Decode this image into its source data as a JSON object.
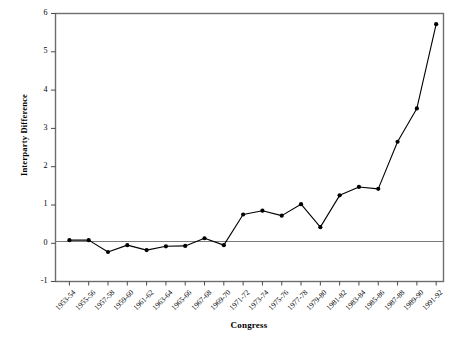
{
  "chart_data": {
    "type": "line",
    "title": "",
    "xlabel": "Congress",
    "ylabel": "Interparty Difference",
    "ylim": [
      -1,
      6
    ],
    "yticks": [
      -1,
      0,
      1,
      2,
      3,
      4,
      5,
      6
    ],
    "ytick_labels": [
      "-1",
      "0",
      "1",
      "2",
      "3",
      "4",
      "5",
      "6"
    ],
    "grid": false,
    "legend": null,
    "marker": "filled-circle",
    "line_color": "#000000",
    "zero_line": true,
    "categories": [
      "1953-54",
      "1955-56",
      "1957-58",
      "1959-60",
      "1961-62",
      "1963-64",
      "1965-66",
      "1967-68",
      "1969-70",
      "1971-72",
      "1973-74",
      "1975-76",
      "1977-78",
      "1979-80",
      "1981-82",
      "1983-84",
      "1985-86",
      "1987-88",
      "1989-90",
      "1991-92"
    ],
    "values": [
      0.08,
      0.08,
      -0.23,
      -0.05,
      -0.18,
      -0.08,
      -0.07,
      0.13,
      -0.05,
      0.75,
      0.85,
      0.72,
      1.02,
      0.42,
      1.25,
      1.47,
      1.42,
      2.65,
      3.52,
      5.72
    ]
  }
}
